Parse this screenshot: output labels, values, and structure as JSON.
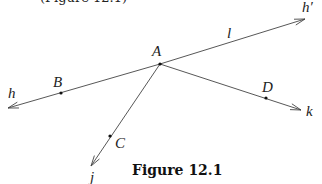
{
  "top_fragment": "(Figure 12.1)",
  "caption": "Figure 12.1",
  "colors": {
    "line": "#444444",
    "point": "#111111",
    "label": "#222222"
  },
  "vertex": {
    "name": "A",
    "x": 160,
    "y": 64,
    "label_x": 152,
    "label_y": 56
  },
  "rays": [
    {
      "name": "h",
      "from": [
        160,
        64
      ],
      "to": [
        8,
        108
      ],
      "label": "h",
      "label_x": 8,
      "label_y": 98
    },
    {
      "name": "h'",
      "from": [
        160,
        64
      ],
      "to": [
        305,
        19
      ],
      "label": "h′",
      "label_x": 302,
      "label_y": 12
    },
    {
      "name": "k",
      "from": [
        160,
        64
      ],
      "to": [
        301,
        110
      ],
      "label": "k",
      "label_x": 306,
      "label_y": 116
    },
    {
      "name": "j",
      "from": [
        160,
        64
      ],
      "to": [
        91,
        166
      ],
      "label": "j",
      "label_x": 90,
      "label_y": 182
    }
  ],
  "line_label": {
    "text": "l",
    "x": 227,
    "y": 38
  },
  "points": [
    {
      "name": "A",
      "x": 160,
      "y": 64,
      "label": "A",
      "label_x": 152,
      "label_y": 56
    },
    {
      "name": "B",
      "x": 61,
      "y": 93,
      "label": "B",
      "label_x": 53,
      "label_y": 87
    },
    {
      "name": "C",
      "x": 110,
      "y": 136,
      "label": "C",
      "label_x": 115,
      "label_y": 148
    },
    {
      "name": "D",
      "x": 266,
      "y": 98,
      "label": "D",
      "label_x": 262,
      "label_y": 92
    }
  ]
}
